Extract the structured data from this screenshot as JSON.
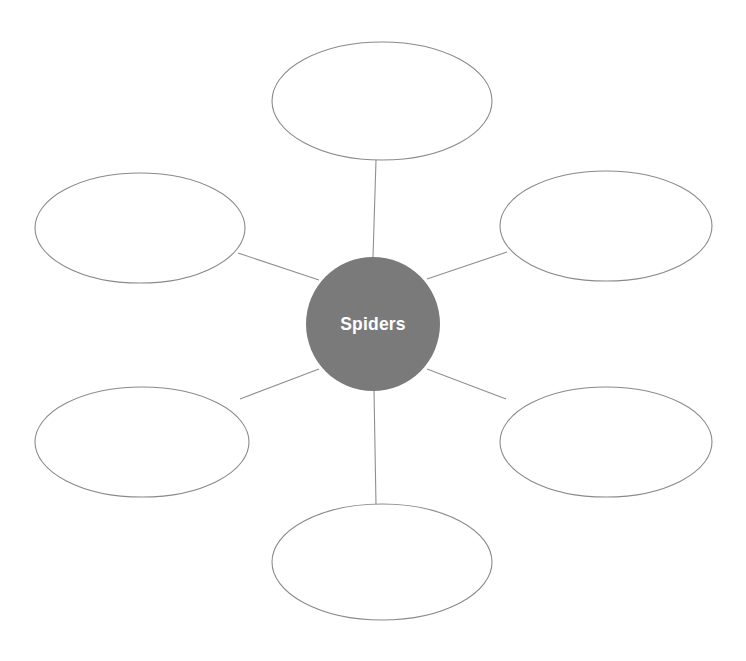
{
  "document": {
    "type": "spider-map",
    "title": "Spiders",
    "background_color": "#ffffff",
    "width": 746,
    "height": 661
  },
  "center": {
    "label": "Spiders",
    "fill_color": "#7a7a7a",
    "text_color": "#ffffff",
    "cx": 373,
    "cy": 324,
    "r": 67
  },
  "style": {
    "oval_stroke_color": "#8a8a8a",
    "oval_fill_color": "#ffffff",
    "connector_color": "#8f8f8f",
    "stroke_width": 1.1
  },
  "branches": [
    {
      "id": "branch-top",
      "name": "top-branch-oval",
      "label": "",
      "cx": 382,
      "cy": 101,
      "rx": 110,
      "ry": 59,
      "connector": {
        "x1": 373,
        "y1": 257,
        "x2": 376,
        "y2": 160
      }
    },
    {
      "id": "branch-top-left",
      "name": "top-left-branch-oval",
      "label": "",
      "cx": 140,
      "cy": 228,
      "rx": 105,
      "ry": 55,
      "connector": {
        "x1": 319,
        "y1": 280,
        "x2": 238,
        "y2": 253
      }
    },
    {
      "id": "branch-top-right",
      "name": "top-right-branch-oval",
      "label": "",
      "cx": 606,
      "cy": 226,
      "rx": 106,
      "ry": 55,
      "connector": {
        "x1": 427,
        "y1": 279,
        "x2": 507,
        "y2": 252
      }
    },
    {
      "id": "branch-bottom-left",
      "name": "bottom-left-branch-oval",
      "label": "",
      "cx": 142,
      "cy": 442,
      "rx": 107,
      "ry": 55,
      "connector": {
        "x1": 319,
        "y1": 369,
        "x2": 240,
        "y2": 399
      }
    },
    {
      "id": "branch-bottom-right",
      "name": "bottom-right-branch-oval",
      "label": "",
      "cx": 606,
      "cy": 442,
      "rx": 106,
      "ry": 55,
      "connector": {
        "x1": 427,
        "y1": 369,
        "x2": 506,
        "y2": 399
      }
    },
    {
      "id": "branch-bottom",
      "name": "bottom-branch-oval",
      "label": "",
      "cx": 382,
      "cy": 562,
      "rx": 110,
      "ry": 58,
      "connector": {
        "x1": 374,
        "y1": 390,
        "x2": 376,
        "y2": 505
      }
    }
  ]
}
